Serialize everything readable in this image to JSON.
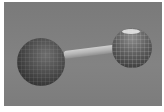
{
  "scene": {
    "description": "3D rendered dumbbell: two gridded spheres connected by a rod",
    "background_color": "#7f7f7f",
    "objects": [
      {
        "name": "left-sphere",
        "color": "#4c4c4c",
        "shading": "dark, faint wireframe grid"
      },
      {
        "name": "connecting-rod",
        "color": "#bdbdbd"
      },
      {
        "name": "right-sphere",
        "color": "#5f5f5f",
        "shading": "visible light wireframe grid, top highlight"
      }
    ]
  }
}
